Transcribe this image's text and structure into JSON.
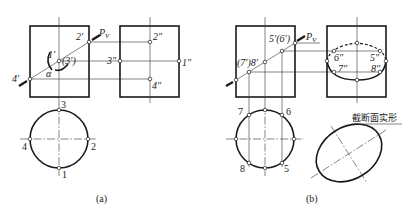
{
  "figure_a": {
    "caption": "(a)",
    "front_view": {
      "plane_label": "P",
      "plane_subscript": "V",
      "points": [
        "1′",
        "2′",
        "(3′)",
        "4′"
      ],
      "angle_label": "α"
    },
    "side_view": {
      "points": [
        "1″",
        "2″",
        "3″",
        "4″"
      ]
    },
    "top_view": {
      "points": [
        "1",
        "2",
        "3",
        "4"
      ]
    }
  },
  "figure_b": {
    "caption": "(b)",
    "front_view": {
      "plane_label": "P",
      "plane_subscript": "V",
      "labels": [
        "5′(6′)",
        "(7′)8′"
      ]
    },
    "side_view": {
      "points": [
        "5″",
        "6″",
        "7″",
        "8″"
      ]
    },
    "top_view": {
      "points": [
        "5",
        "6",
        "7",
        "8"
      ]
    },
    "section_label": "截断面实形"
  }
}
